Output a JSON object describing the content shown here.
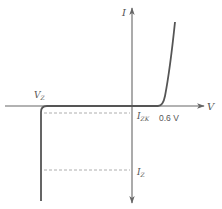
{
  "diagram": {
    "type": "zener-diode-iv-characteristic",
    "axes": {
      "x_label": "V",
      "y_label": "I"
    },
    "labels": {
      "vz": {
        "main": "V",
        "sub": "Z"
      },
      "izk": {
        "main": "I",
        "sub": "ZK"
      },
      "forward_voltage": "0.6 V",
      "iz": {
        "main": "I",
        "sub": "Z"
      }
    },
    "colors": {
      "axis": "#666666",
      "curve": "#555555",
      "dashed": "#999999",
      "text": "#555555"
    }
  }
}
